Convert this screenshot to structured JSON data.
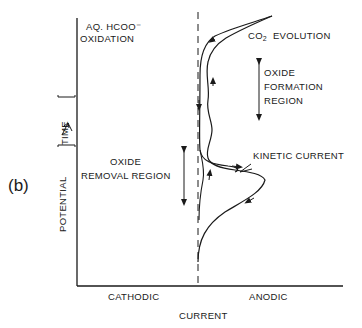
{
  "figure": {
    "panel_label": "(b)",
    "y_axis_label": "POTENTIAL",
    "y_axis_bracket_label": "TIME",
    "x_axis_label": "CURRENT",
    "x_left_label": "CATHODIC",
    "x_right_label": "ANODIC"
  },
  "annotations": {
    "aq_oxidation_line1": "AQ. HCOO⁻",
    "aq_oxidation_line2": "OXIDATION",
    "co2_prefix": "CO",
    "co2_sub": "2",
    "co2_suffix": "EVOLUTION",
    "oxide_formation_line1": "OXIDE",
    "oxide_formation_line2": "FORMATION",
    "oxide_formation_line3": "REGION",
    "oxide_removal_line1": "OXIDE",
    "oxide_removal_line2": "REMOVAL  REGION",
    "kinetic_current": "KINETIC   CURRENT"
  },
  "colors": {
    "ink": "#1a1a1a",
    "background": "#ffffff"
  }
}
